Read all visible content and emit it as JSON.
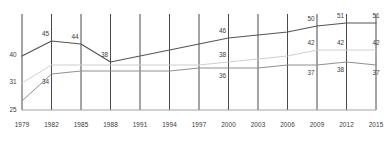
{
  "chart_data": {
    "type": "line",
    "title": "",
    "subtitle": "",
    "xlabel": "",
    "ylabel": "",
    "grid": "vertical-only",
    "legend": "none",
    "xlim": [
      1979,
      2015
    ],
    "ylim": [
      22,
      54
    ],
    "x": [
      1979,
      1982,
      1985,
      1988,
      1991,
      1994,
      1997,
      2000,
      2003,
      2006,
      2009,
      2012,
      2015
    ],
    "categories": [
      "1979",
      "1982",
      "1985",
      "1988",
      "1991",
      "1994",
      "1997",
      "2000",
      "2003",
      "2006",
      "2009",
      "2012",
      "2015"
    ],
    "series": [
      {
        "name": "series-dark",
        "color": "#555555",
        "values": [
          40,
          45,
          44,
          38,
          40,
          42,
          44,
          46,
          47,
          48,
          50,
          51,
          51
        ],
        "labels": [
          {
            "x": 1979,
            "value": 40
          },
          {
            "x": 1982,
            "value": 45
          },
          {
            "x": 1985,
            "value": 44
          },
          {
            "x": 1988,
            "value": 38
          },
          {
            "x": 2000,
            "value": 46
          },
          {
            "x": 2009,
            "value": 50
          },
          {
            "x": 2012,
            "value": 51
          },
          {
            "x": 2015,
            "value": 51
          }
        ]
      },
      {
        "name": "series-light",
        "color": "#cfcfcf",
        "values": [
          31,
          37,
          37,
          37,
          37,
          37,
          37,
          38,
          39,
          40,
          42,
          42,
          42
        ],
        "labels": [
          {
            "x": 1979,
            "value": 31
          },
          {
            "x": 2000,
            "value": 38
          },
          {
            "x": 2009,
            "value": 42
          },
          {
            "x": 2012,
            "value": 42
          },
          {
            "x": 2015,
            "value": 42
          }
        ]
      },
      {
        "name": "series-mid",
        "color": "#909090",
        "values": [
          25,
          34,
          35,
          35,
          35,
          35,
          36,
          36,
          36,
          37,
          37,
          38,
          37
        ],
        "labels": [
          {
            "x": 1979,
            "value": 25
          },
          {
            "x": 1982,
            "value": 34
          },
          {
            "x": 2000,
            "value": 36
          },
          {
            "x": 2009,
            "value": 37
          },
          {
            "x": 2012,
            "value": 38
          },
          {
            "x": 2015,
            "value": 37
          }
        ]
      }
    ]
  },
  "axis": {
    "ticks": [
      "1979",
      "1982",
      "1985",
      "1988",
      "1991",
      "1994",
      "1997",
      "2000",
      "2003",
      "2006",
      "2009",
      "2012",
      "2015"
    ]
  },
  "colors": {
    "grid": "#4a4a4a",
    "baseline": "#9a9a9a",
    "series_dark": "#555555",
    "series_light": "#cfcfcf",
    "series_mid": "#909090",
    "text": "#3a3a3a",
    "background": "#ffffff"
  }
}
